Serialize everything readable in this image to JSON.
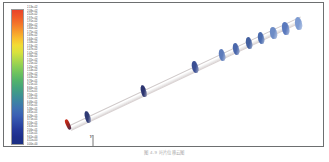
{
  "figure": {
    "caption": "图 4-9 叶片位移云图",
    "border_color": "#6d6f70",
    "background": "#ffffff"
  },
  "legend": {
    "name": "contour-colorbar",
    "colormap": "jet-rainbow",
    "orientation": "vertical",
    "max_color": "#e8442a",
    "min_color": "#1b2f82",
    "stops": [
      "#e8442a",
      "#f05a28",
      "#f4772a",
      "#f79a2c",
      "#f9bd2f",
      "#f2dc35",
      "#d9e23d",
      "#b2d94a",
      "#8ccf55",
      "#6cc25f",
      "#53b36b",
      "#45a47c",
      "#3e9490",
      "#3d83a4",
      "#3f71b2",
      "#3a5fb4",
      "#2f4ca8",
      "#25399a",
      "#1e2f8c",
      "#1b2f82"
    ],
    "tick_labels": [
      "2.13e+02",
      "2.08e+02",
      "2.02e+02",
      "1.97e+02",
      "1.91e+02",
      "1.86e+02",
      "1.80e+02",
      "1.75e+02",
      "1.69e+02",
      "1.64e+02",
      "1.58e+02",
      "1.53e+02",
      "1.47e+02",
      "1.42e+02",
      "1.36e+02",
      "1.31e+02",
      "1.25e+02",
      "1.20e+02",
      "1.14e+02",
      "1.09e+02",
      "1.03e+02",
      "9.76e+01",
      "9.21e+01",
      "8.66e+01",
      "8.11e+01",
      "7.56e+01",
      "7.01e+01",
      "6.46e+01",
      "5.91e+01",
      "5.36e+01",
      "4.81e+01",
      "4.26e+01",
      "3.71e+01",
      "3.16e+01",
      "2.61e+01",
      "2.06e+01",
      "1.51e+01",
      "9.61e+00",
      "4.11e+00",
      "0.00e+00"
    ]
  },
  "axes_triad": {
    "name": "orientation-axes",
    "x_label": "X",
    "y_label": "Y",
    "z_label": "Z",
    "color": "#6a6a6a"
  },
  "model": {
    "name": "rotor-blade-assembly",
    "shaft_color": "#ededed",
    "root_marker_color": "#d8301a",
    "blades": [
      {
        "id": "blade-01",
        "left": 23,
        "top": 108,
        "w": 5.0,
        "h": 11.5,
        "rot": -16,
        "fill": "#2f3a74"
      },
      {
        "id": "blade-02",
        "left": 79,
        "top": 82,
        "w": 5.2,
        "h": 11.5,
        "rot": -15,
        "fill": "#2c3570"
      },
      {
        "id": "blade-03",
        "left": 130,
        "top": 58,
        "w": 6.0,
        "h": 12.0,
        "rot": -14,
        "fill": "#3b4f93"
      },
      {
        "id": "blade-04",
        "left": 157,
        "top": 46,
        "w": 6.2,
        "h": 12.0,
        "rot": -13,
        "fill": "#5e7cbb"
      },
      {
        "id": "blade-05",
        "left": 171,
        "top": 40,
        "w": 6.2,
        "h": 12.0,
        "rot": -13,
        "fill": "#4a67ab"
      },
      {
        "id": "blade-06",
        "left": 184,
        "top": 34,
        "w": 6.4,
        "h": 12.2,
        "rot": -12,
        "fill": "#43609f"
      },
      {
        "id": "blade-07",
        "left": 196,
        "top": 29,
        "w": 6.4,
        "h": 12.2,
        "rot": -12,
        "fill": "#4a6bae"
      },
      {
        "id": "blade-08",
        "left": 208,
        "top": 24,
        "w": 6.6,
        "h": 12.4,
        "rot": -11,
        "fill": "#6d8cc6"
      },
      {
        "id": "blade-09",
        "left": 220,
        "top": 19,
        "w": 6.8,
        "h": 12.6,
        "rot": -11,
        "fill": "#5a79bd"
      },
      {
        "id": "blade-10",
        "left": 233,
        "top": 14,
        "w": 7.4,
        "h": 13.4,
        "rot": -10,
        "fill": "#7d9bd2"
      }
    ]
  }
}
